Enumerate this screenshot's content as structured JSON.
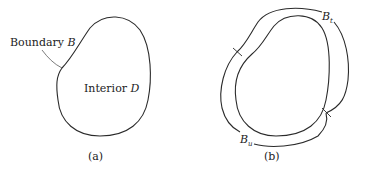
{
  "figure_a": {
    "boundary_label": "Boundary",
    "boundary_symbol": "B",
    "interior_label": "Interior",
    "interior_symbol": "D",
    "caption": "(a)"
  },
  "figure_b": {
    "traction_label": "B",
    "traction_subscript": "t",
    "displacement_label": "B",
    "displacement_subscript": "u",
    "caption": "(b)"
  }
}
